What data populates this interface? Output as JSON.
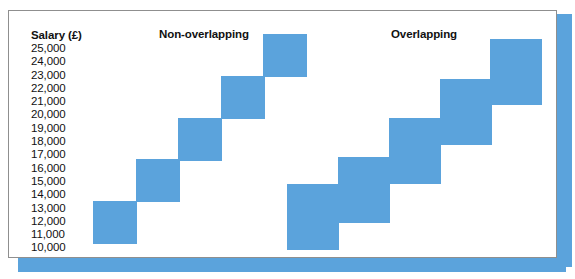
{
  "figure": {
    "axis_title": "Salary (£)",
    "tick_labels": [
      "25,000",
      "24,000",
      "23,000",
      "22,000",
      "21,000",
      "20,000",
      "19,000",
      "18,000",
      "17,000",
      "16,000",
      "15,000",
      "14,000",
      "13,000",
      "12,000",
      "11,000",
      "10,000"
    ],
    "headings": {
      "left": "Non-overlapping",
      "right": "Overlapping"
    },
    "colors": {
      "square_fill": "#5BA3DC",
      "shadow": "#5BA3DC",
      "card_border": "#8f8f8f",
      "text": "#111111",
      "background": "#ffffff"
    }
  },
  "chart_data": {
    "type": "bar",
    "title": "",
    "xlabel": "",
    "ylabel": "Salary (£)",
    "ylim": [
      10000,
      25000
    ],
    "yticks": [
      10000,
      11000,
      12000,
      13000,
      14000,
      15000,
      16000,
      17000,
      18000,
      19000,
      20000,
      21000,
      22000,
      23000,
      24000,
      25000
    ],
    "grid": false,
    "legend": "none",
    "series": [
      {
        "name": "Non-overlapping",
        "boxes": [
          {
            "index": 1,
            "low": 10000,
            "high": 13000,
            "x_px": 92,
            "y_px": 200,
            "w_px": 44,
            "h_px": 43
          },
          {
            "index": 2,
            "low": 13000,
            "high": 16000,
            "x_px": 135,
            "y_px": 158,
            "w_px": 44,
            "h_px": 43
          },
          {
            "index": 3,
            "low": 16000,
            "high": 19000,
            "x_px": 177,
            "y_px": 117,
            "w_px": 44,
            "h_px": 43
          },
          {
            "index": 4,
            "low": 19000,
            "high": 22000,
            "x_px": 220,
            "y_px": 75,
            "w_px": 44,
            "h_px": 43
          },
          {
            "index": 5,
            "low": 22000,
            "high": 25000,
            "x_px": 262,
            "y_px": 33,
            "w_px": 44,
            "h_px": 43
          }
        ]
      },
      {
        "name": "Overlapping",
        "boxes": [
          {
            "index": 1,
            "low": 10000,
            "high": 14000,
            "x_px": 286,
            "y_px": 183,
            "w_px": 52,
            "h_px": 66
          },
          {
            "index": 2,
            "low": 12000,
            "high": 17000,
            "x_px": 337,
            "y_px": 156,
            "w_px": 52,
            "h_px": 66
          },
          {
            "index": 3,
            "low": 15000,
            "high": 20000,
            "x_px": 388,
            "y_px": 117,
            "w_px": 52,
            "h_px": 66
          },
          {
            "index": 4,
            "low": 17000,
            "high": 22000,
            "x_px": 439,
            "y_px": 78,
            "w_px": 52,
            "h_px": 66
          },
          {
            "index": 5,
            "low": 21000,
            "high": 25000,
            "x_px": 489,
            "y_px": 38,
            "w_px": 52,
            "h_px": 66
          }
        ]
      }
    ]
  }
}
